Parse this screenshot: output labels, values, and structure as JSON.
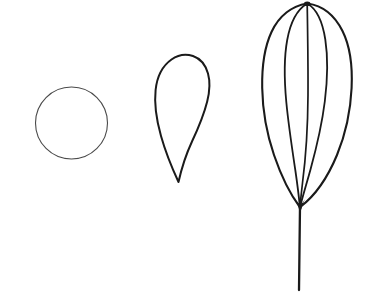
{
  "figure": {
    "title": "Three-stage outline line drawing",
    "background_color": "#ffffff",
    "ink_color": "#1a1a1a",
    "faint_ink_color": "#4a4a4a",
    "width": 387,
    "height": 305,
    "caption": "",
    "labels": []
  },
  "chart_data": {
    "type": "diagram",
    "title": "Three-stage outline line drawing",
    "shape_count": 3,
    "shapes": [
      {
        "id": "shape-1",
        "name": "circle",
        "label": "",
        "description": "Plain thin circular outline",
        "stroke_color": "#4a4a4a",
        "stroke_width": 1.1,
        "filled": false,
        "center": [
          71.5,
          123.0
        ],
        "radius_x": 36.0,
        "radius_y": 36.0,
        "bounds": [
          35.5,
          87.0,
          107.5,
          159.0
        ]
      },
      {
        "id": "shape-2",
        "name": "teardrop-outline",
        "label": "",
        "description": "Inverted teardrop: broad rounded dome on top tapering to a point at bottom",
        "stroke_color": "#1a1a1a",
        "stroke_width": 2.0,
        "filled": false,
        "apex_point": [
          178.0,
          182.0
        ],
        "dome_top": [
          181.0,
          55.0
        ],
        "bounds": [
          155.0,
          55.0,
          209.0,
          182.0
        ]
      },
      {
        "id": "shape-3",
        "name": "multi-petal-bud-with-stem",
        "label": "",
        "description": "Ovate bud formed by five curved ribs converging at a top apex and a bottom node, with a straight vertical stem below",
        "stroke_color": "#1a1a1a",
        "stroke_width": 2.1,
        "filled": false,
        "top_apex": [
          307.0,
          3.0
        ],
        "bottom_node": [
          300.0,
          207.0
        ],
        "stem_end": [
          299.0,
          290.0
        ],
        "rib_count": 5,
        "rib_x_at_widest": [
          262.0,
          287.0,
          308.0,
          326.0,
          352.0
        ],
        "widest_y": 100.0,
        "bounds": [
          262.0,
          3.0,
          352.0,
          290.0
        ]
      }
    ],
    "axis": {
      "visible": false
    },
    "grid": false,
    "legend": {
      "visible": false
    }
  }
}
